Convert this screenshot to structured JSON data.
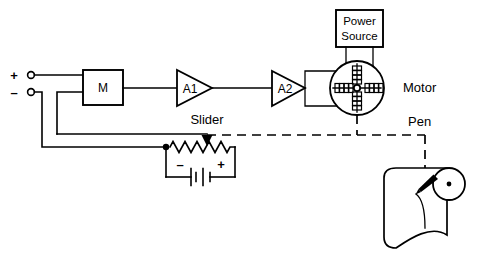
{
  "figure": {
    "kind": "electrical-schematic",
    "background_color": "#ffffff",
    "line_color": "#000000"
  },
  "terminals": {
    "positive": {
      "sign": "+",
      "name": "positive-input-terminal"
    },
    "negative": {
      "sign": "–",
      "name": "negative-input-terminal"
    }
  },
  "blocks": {
    "modulator": {
      "label": "M",
      "name": "modulator-block"
    },
    "amplifier_1": {
      "label": "A1",
      "name": "amplifier-a1"
    },
    "amplifier_2": {
      "label": "A2",
      "name": "amplifier-a2"
    },
    "power_source": {
      "line1": "Power",
      "line2": "Source",
      "name": "power-source-block"
    }
  },
  "labels": {
    "motor": "Motor",
    "slider": "Slider",
    "pen": "Pen"
  },
  "feedback": {
    "battery_negative": "–",
    "battery_positive": "+"
  },
  "recorder": {
    "paper_name": "chart-paper",
    "roller_name": "chart-roller",
    "pen_name": "recording-pen",
    "trace_name": "pen-trace"
  }
}
